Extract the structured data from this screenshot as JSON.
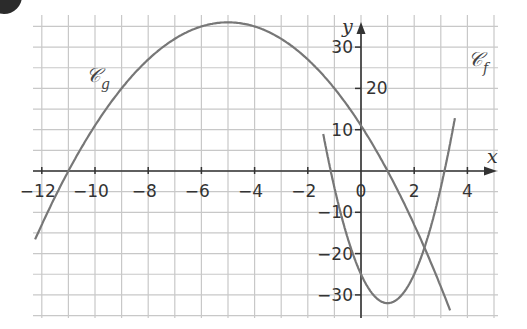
{
  "badge": {
    "color": "#2b2b2b"
  },
  "colors": {
    "grid": "#c8c8c8",
    "axis": "#333333",
    "curve": "#777777",
    "text": "#333333"
  },
  "chart_data": {
    "type": "line",
    "title": "",
    "xlabel": "x",
    "ylabel": "y",
    "xlim": [
      -12.1,
      4.9
    ],
    "ylim": [
      -35.5,
      37.5
    ],
    "grid": true,
    "grid_step_x": 1,
    "grid_step_y": 5,
    "x_ticks": [
      -12,
      -10,
      -8,
      -6,
      -4,
      -2,
      0,
      2,
      4
    ],
    "x_tick_labels": [
      "−12",
      "−10",
      "−8",
      "−6",
      "−4",
      "−2",
      "0",
      "2",
      "4"
    ],
    "y_ticks": [
      -30,
      -20,
      -10,
      10,
      20,
      30
    ],
    "y_tick_labels": [
      "−30",
      "−20",
      "−10",
      "10",
      "20",
      "30"
    ],
    "series": [
      {
        "name": "𝒞g",
        "label_main": "𝒞",
        "label_sub": "g",
        "expression": "g(x) = -(x+5)^2 + 36",
        "vertex": [
          -5,
          36
        ],
        "roots": [
          -11,
          1
        ],
        "y_intercept": 11,
        "x": [
          -12.2,
          -11,
          -10,
          -8,
          -6,
          -5,
          -4,
          -2,
          0,
          1,
          2,
          3.3
        ],
        "values": [
          -19.8,
          0,
          11,
          27,
          35,
          36,
          35,
          27,
          11,
          0,
          -13,
          -33.3
        ]
      },
      {
        "name": "𝒞f",
        "label_main": "𝒞",
        "label_sub": "f",
        "expression": "f(x) = 7(x-1)^2 - 32",
        "vertex": [
          1,
          -32
        ],
        "roots": [
          -1.14,
          3.14
        ],
        "y_intercept": -25,
        "x": [
          -1.4,
          -1,
          0,
          1,
          2,
          3,
          3.5
        ],
        "values": [
          8.3,
          -4,
          -25,
          -32,
          -25,
          -4,
          11.75
        ]
      }
    ],
    "annotations": [
      {
        "text": "𝒞g",
        "near": [
          -9.3,
          21
        ]
      },
      {
        "text": "𝒞f",
        "near": [
          4.3,
          27
        ]
      }
    ],
    "intersections": [
      [
        -1.85,
        24.7
      ],
      [
        2.2,
        -17.9
      ]
    ],
    "legend": "none (inline curve labels)"
  }
}
